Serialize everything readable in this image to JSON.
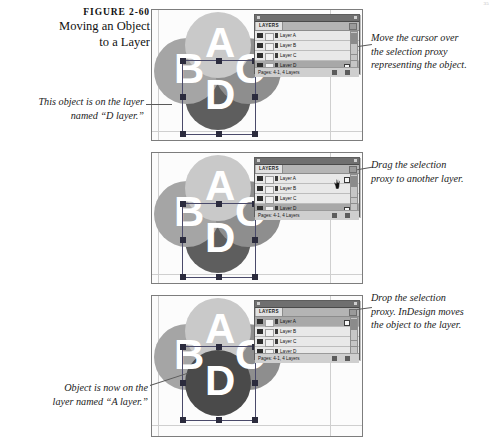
{
  "page": {
    "folio": "35"
  },
  "figure": {
    "number": "FIGURE 2-60",
    "title_line1": "Moving an Object",
    "title_line2": "to a Layer"
  },
  "callouts": [
    {
      "id": "callout-object-on-d-layer",
      "line1": "This object is on the layer",
      "line2": "named “D layer.”"
    },
    {
      "id": "callout-move-cursor",
      "line1": "Move the cursor over",
      "line2": "the selection proxy",
      "line3": "representing the object."
    },
    {
      "id": "callout-drag-proxy",
      "line1": "Drag the selection",
      "line2": "proxy to another layer."
    },
    {
      "id": "callout-drop-proxy",
      "line1": "Drop the selection",
      "line2": "proxy. InDesign moves",
      "line3": "the object to the layer."
    },
    {
      "id": "callout-object-now-on-a-layer",
      "line1": "Object is now on the",
      "line2": "layer named “A layer.”"
    }
  ],
  "artwork": {
    "letters": {
      "a": "A",
      "b": "B",
      "c": "C",
      "d": "D"
    },
    "colors": {
      "circle_a": "#c9c9c9",
      "circle_b": "#a5a5a5",
      "circle_c": "#8e8e8e",
      "circle_d": "#5e5e5e",
      "glyph": "#ffffff",
      "selection": "#4a4a6a"
    }
  },
  "palette": {
    "tab_label": "LAYERS",
    "status_text": "Pages: 4-1, 4 Layers",
    "icons": {
      "menu": "panel-menu-icon",
      "eye": "eye-visibility-icon",
      "lock": "lock-toggle-icon",
      "pen": "pen-edit-icon",
      "proxy": "selection-proxy-icon",
      "new_layer": "new-layer-icon",
      "delete_layer": "trash-icon",
      "scroll_up": "scroll-up-arrow-icon",
      "scroll_down": "scroll-down-arrow-icon"
    },
    "layers": [
      {
        "name": "Layer A"
      },
      {
        "name": "Layer B"
      },
      {
        "name": "Layer C"
      },
      {
        "name": "Layer D"
      }
    ]
  },
  "panels": [
    {
      "id": "panel-step-1",
      "selected_layer": "Layer D",
      "proxy_on_layer": "Layer D"
    },
    {
      "id": "panel-step-2",
      "selected_layer": "Layer D",
      "proxy_on_layer": "Layer D"
    },
    {
      "id": "panel-step-3",
      "selected_layer": "Layer A",
      "proxy_on_layer": "Layer A"
    }
  ]
}
